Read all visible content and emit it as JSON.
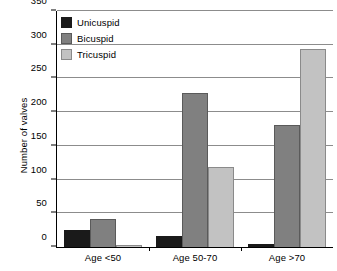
{
  "chart_data": {
    "type": "bar",
    "title": "",
    "xlabel": "",
    "ylabel": "Number of valves",
    "categories": [
      "Age <50",
      "Age 50-70",
      "Age >70"
    ],
    "series": [
      {
        "name": "Unicuspid",
        "color": "#1a1a1a",
        "values": [
          25,
          17,
          5
        ]
      },
      {
        "name": "Bicuspid",
        "color": "#808080",
        "values": [
          41,
          229,
          181
        ]
      },
      {
        "name": "Tricuspid",
        "color": "#c2c2c2",
        "values": [
          3,
          119,
          294
        ]
      }
    ],
    "ylim": [
      0,
      350
    ],
    "yticks": [
      0,
      50,
      100,
      150,
      200,
      250,
      300,
      350
    ],
    "ytick_labels": [
      "0",
      "50",
      "100",
      "150",
      "200",
      "250",
      "300",
      "350"
    ],
    "grid": "horizontal",
    "legend_position": "top-left-inside"
  }
}
